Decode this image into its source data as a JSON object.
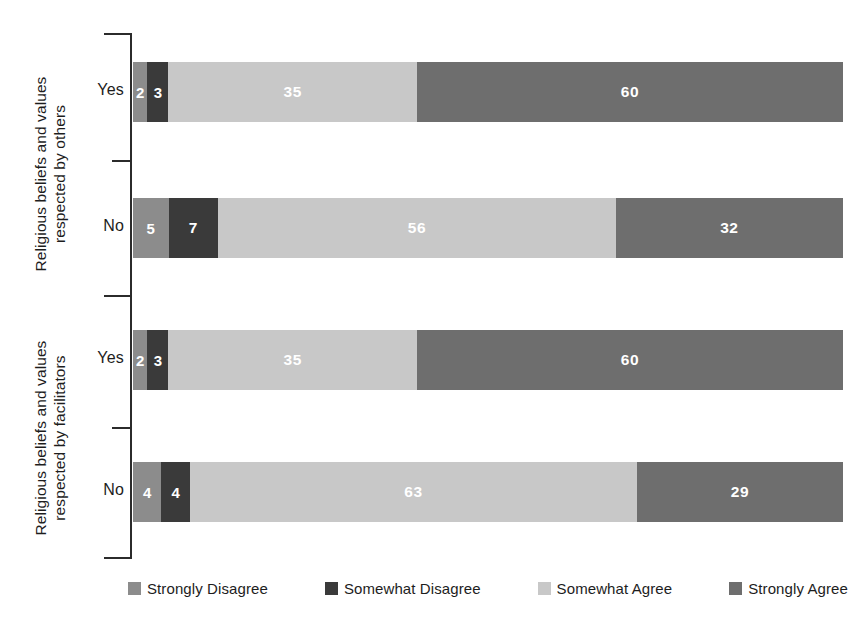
{
  "chart_data": {
    "type": "bar",
    "orientation": "horizontal",
    "stacked": true,
    "stack_mode": "percent",
    "title": "",
    "subtitle": "",
    "xlabel": "",
    "ylabel": "",
    "xlim": [
      0,
      100
    ],
    "grid": false,
    "legend_position": "bottom",
    "group_labels": [
      "Religious beliefs and values\nrespected by others",
      "Religious beliefs and values\nrespected by facilitators"
    ],
    "categories": [
      "Yes",
      "No",
      "Yes",
      "No"
    ],
    "legend": [
      "Strongly Disagree",
      "Somewhat Disagree",
      "Somewhat Agree",
      "Strongly Agree"
    ],
    "series": [
      {
        "name": "Strongly Disagree",
        "values": [
          2,
          5,
          2,
          4
        ]
      },
      {
        "name": "Somewhat Disagree",
        "values": [
          3,
          7,
          3,
          4
        ]
      },
      {
        "name": "Somewhat Agree",
        "values": [
          35,
          56,
          35,
          63
        ]
      },
      {
        "name": "Strongly Agree",
        "values": [
          60,
          32,
          60,
          29
        ]
      }
    ],
    "colors": {
      "strongly_disagree": "#8c8c8c",
      "somewhat_disagree": "#3a3a3a",
      "somewhat_agree": "#c8c8c8",
      "strongly_agree": "#6e6e6e",
      "axis": "#2b2b2b",
      "value_label": "#ffffff",
      "background": "#ffffff"
    },
    "groups": [
      {
        "label": "Religious beliefs and values\nrespected by others",
        "rows": [
          {
            "category": "Yes",
            "values": [
              2,
              3,
              35,
              60
            ]
          },
          {
            "category": "No",
            "values": [
              5,
              7,
              56,
              32
            ]
          }
        ]
      },
      {
        "label": "Religious beliefs and values\nrespected by facilitators",
        "rows": [
          {
            "category": "Yes",
            "values": [
              2,
              3,
              35,
              60
            ]
          },
          {
            "category": "No",
            "values": [
              4,
              4,
              63,
              29
            ]
          }
        ]
      }
    ]
  },
  "bars": [
    {
      "category": "Yes",
      "segments": [
        {
          "label": "Strongly Disagree",
          "value": "2",
          "pct": 2,
          "color": "#8c8c8c"
        },
        {
          "label": "Somewhat Disagree",
          "value": "3",
          "pct": 3,
          "color": "#3a3a3a"
        },
        {
          "label": "Somewhat Agree",
          "value": "35",
          "pct": 35,
          "color": "#c8c8c8"
        },
        {
          "label": "Strongly Agree",
          "value": "60",
          "pct": 60,
          "color": "#6e6e6e"
        }
      ]
    },
    {
      "category": "No",
      "segments": [
        {
          "label": "Strongly Disagree",
          "value": "5",
          "pct": 5,
          "color": "#8c8c8c"
        },
        {
          "label": "Somewhat Disagree",
          "value": "7",
          "pct": 7,
          "color": "#3a3a3a"
        },
        {
          "label": "Somewhat Agree",
          "value": "56",
          "pct": 56,
          "color": "#c8c8c8"
        },
        {
          "label": "Strongly Agree",
          "value": "32",
          "pct": 32,
          "color": "#6e6e6e"
        }
      ]
    },
    {
      "category": "Yes",
      "segments": [
        {
          "label": "Strongly Disagree",
          "value": "2",
          "pct": 2,
          "color": "#8c8c8c"
        },
        {
          "label": "Somewhat Disagree",
          "value": "3",
          "pct": 3,
          "color": "#3a3a3a"
        },
        {
          "label": "Somewhat Agree",
          "value": "35",
          "pct": 35,
          "color": "#c8c8c8"
        },
        {
          "label": "Strongly Agree",
          "value": "60",
          "pct": 60,
          "color": "#6e6e6e"
        }
      ]
    },
    {
      "category": "No",
      "segments": [
        {
          "label": "Strongly Disagree",
          "value": "4",
          "pct": 4,
          "color": "#8c8c8c"
        },
        {
          "label": "Somewhat Disagree",
          "value": "4",
          "pct": 4,
          "color": "#3a3a3a"
        },
        {
          "label": "Somewhat Agree",
          "value": "63",
          "pct": 63,
          "color": "#c8c8c8"
        },
        {
          "label": "Strongly Agree",
          "value": "29",
          "pct": 29,
          "color": "#6e6e6e"
        }
      ]
    }
  ],
  "axis": {
    "group_others": "Religious beliefs and values\nrespected by others",
    "group_facilitators": "Religious beliefs and values\nrespected by facilitators",
    "cat_yes_top": "Yes",
    "cat_no_top": "No",
    "cat_yes_bottom": "Yes",
    "cat_no_bottom": "No"
  },
  "legend": {
    "items": [
      {
        "label": "Strongly Disagree",
        "color": "#8c8c8c"
      },
      {
        "label": "Somewhat Disagree",
        "color": "#3a3a3a"
      },
      {
        "label": "Somewhat Agree",
        "color": "#c8c8c8"
      },
      {
        "label": "Strongly Agree",
        "color": "#6e6e6e"
      }
    ]
  }
}
